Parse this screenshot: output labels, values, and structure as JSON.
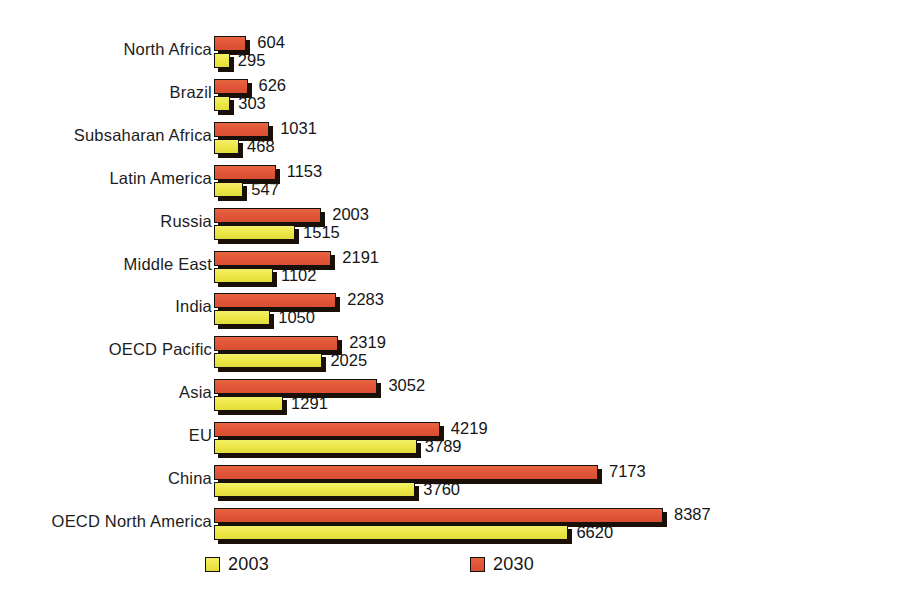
{
  "chart_data": {
    "type": "bar",
    "orientation": "horizontal",
    "title": "",
    "xlabel": "",
    "ylabel": "",
    "grid": false,
    "legend_position": "bottom",
    "xlim": [
      0,
      8387
    ],
    "categories": [
      "North Africa",
      "Brazil",
      "Subsaharan Africa",
      "Latin America",
      "Russia",
      "Middle East",
      "India",
      "OECD Pacific",
      "Asia",
      "EU",
      "China",
      "OECD North America"
    ],
    "series": [
      {
        "name": "2030",
        "color": "#e2573a",
        "values": [
          604,
          626,
          1031,
          1153,
          2003,
          2191,
          2283,
          2319,
          3052,
          4219,
          7173,
          8387
        ]
      },
      {
        "name": "2003",
        "color": "#ece746",
        "values": [
          295,
          303,
          468,
          547,
          1515,
          1102,
          1050,
          2025,
          1291,
          3789,
          3760,
          6620
        ]
      }
    ]
  },
  "legend": {
    "items": [
      {
        "label": "2003",
        "swatch": "yell"
      },
      {
        "label": "2030",
        "swatch": "red"
      }
    ]
  }
}
